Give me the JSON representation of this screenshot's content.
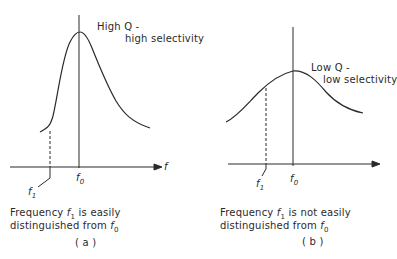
{
  "panels": [
    {
      "id": "a",
      "label": "( a )",
      "curve_annotation_line1": "High Q -",
      "curve_annotation_line2": "high selectivity",
      "axis_label": "f",
      "f0_label": "f",
      "f0_sub": "0",
      "f1_label": "f",
      "f1_sub": "1",
      "caption_line1_pre": "Frequency ",
      "caption_f": "f",
      "caption_f_sub": "1",
      "caption_line1_post": " is easily",
      "caption_line2_pre": "distinguished from ",
      "caption_f0": "f",
      "caption_f0_sub": "0"
    },
    {
      "id": "b",
      "label": "( b )",
      "curve_annotation_line1": "Low Q -",
      "curve_annotation_line2": "low selectivity",
      "f0_label": "f",
      "f0_sub": "0",
      "f1_label": "f",
      "f1_sub": "1",
      "caption_line1_pre": "Frequency ",
      "caption_f": "f",
      "caption_f_sub": "1",
      "caption_line1_post": " is not easily",
      "caption_line2_pre": "distinguished from ",
      "caption_f0": "f",
      "caption_f0_sub": "0"
    }
  ]
}
